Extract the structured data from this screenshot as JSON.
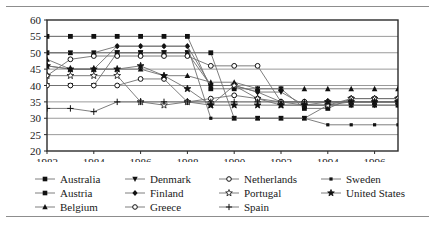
{
  "chart_data": {
    "type": "line",
    "title": "",
    "xlabel": "",
    "ylabel": "",
    "xlim": [
      1982,
      1997
    ],
    "ylim": [
      20,
      60
    ],
    "ytick_step": 5,
    "yticks": [
      20,
      25,
      30,
      35,
      40,
      45,
      50,
      55,
      60
    ],
    "xticks": [
      1982,
      1984,
      1986,
      1988,
      1990,
      1992,
      1994,
      1996
    ],
    "xtick_labels": [
      "1982",
      "1984",
      "1986",
      "1988",
      "1990",
      "1992",
      "1994",
      "1996"
    ],
    "x": [
      1982,
      1983,
      1984,
      1985,
      1986,
      1987,
      1988,
      1989,
      1990,
      1991,
      1992,
      1993,
      1994,
      1995,
      1996,
      1997
    ],
    "grid": true,
    "grid_axis": "y",
    "legend_position": "below",
    "legend_columns": 4,
    "series": [
      {
        "name": "Australia",
        "marker": "square-filled",
        "values": [
          55,
          55,
          55,
          55,
          55,
          55,
          55,
          39,
          39,
          39,
          39,
          33,
          33,
          36,
          36,
          36
        ]
      },
      {
        "name": "Austria",
        "marker": "square-filled",
        "values": [
          50,
          50,
          50,
          50,
          50,
          50,
          50,
          50,
          30,
          30,
          30,
          30,
          34,
          34,
          34,
          34
        ]
      },
      {
        "name": "Belgium",
        "marker": "triangle-filled",
        "values": [
          48,
          45,
          45,
          45,
          45,
          43,
          43,
          41,
          41,
          39,
          39,
          39,
          39,
          39,
          39,
          39
        ]
      },
      {
        "name": "Denmark",
        "marker": "triangle-down",
        "values": [
          40,
          40,
          40,
          50,
          50,
          50,
          50,
          40,
          40,
          38,
          38,
          34,
          34,
          34,
          34,
          34
        ]
      },
      {
        "name": "Finland",
        "marker": "diamond-filled",
        "values": [
          46,
          45,
          45,
          52,
          52,
          52,
          52,
          40,
          40,
          38,
          35,
          34,
          34,
          35,
          35,
          35
        ]
      },
      {
        "name": "Greece",
        "marker": "circle-open",
        "values": [
          43,
          48,
          49,
          49,
          49,
          49,
          49,
          46,
          46,
          46,
          35,
          35,
          35,
          35,
          35,
          35
        ]
      },
      {
        "name": "Netherlands",
        "marker": "circle-open",
        "values": [
          40,
          40,
          40,
          40,
          42,
          42,
          35,
          36,
          37,
          36,
          35,
          35,
          35,
          35,
          35,
          35
        ]
      },
      {
        "name": "Portugal",
        "marker": "star-open",
        "values": [
          43,
          43,
          43,
          43,
          35,
          34,
          35,
          34,
          40,
          36,
          34,
          34,
          34,
          36,
          36,
          36
        ]
      },
      {
        "name": "Spain",
        "marker": "plus",
        "values": [
          33,
          33,
          32,
          35,
          35,
          35,
          35,
          35,
          35,
          35,
          35,
          35,
          35,
          35,
          35,
          35
        ]
      },
      {
        "name": "Sweden",
        "marker": "square-small",
        "values": [
          50,
          50,
          50,
          52,
          52,
          52,
          52,
          30,
          30,
          30,
          30,
          30,
          28,
          28,
          28,
          28
        ]
      },
      {
        "name": "United States",
        "marker": "star-filled",
        "values": [
          46,
          45,
          45,
          45,
          46,
          43,
          39,
          34,
          34,
          34,
          34,
          34,
          35,
          35,
          35,
          35
        ]
      }
    ]
  },
  "legend": {
    "columns": [
      {
        "items": [
          {
            "label": "Australia",
            "marker": "square-filled"
          },
          {
            "label": "Austria",
            "marker": "square-filled"
          },
          {
            "label": "Belgium",
            "marker": "triangle-filled"
          }
        ]
      },
      {
        "items": [
          {
            "label": "Denmark",
            "marker": "triangle-down"
          },
          {
            "label": "Finland",
            "marker": "diamond-filled"
          },
          {
            "label": "Greece",
            "marker": "circle-open"
          }
        ]
      },
      {
        "items": [
          {
            "label": "Netherlands",
            "marker": "circle-open"
          },
          {
            "label": "Portugal",
            "marker": "star-open"
          },
          {
            "label": "Spain",
            "marker": "plus"
          }
        ]
      },
      {
        "items": [
          {
            "label": "Sweden",
            "marker": "square-small"
          },
          {
            "label": "United States",
            "marker": "star-filled"
          }
        ]
      }
    ]
  },
  "colors": {
    "line": "#6f6f6f",
    "marker": "#111111",
    "grid": "#9a9a9a",
    "frame": "#2b2b2b",
    "rule": "#8d8d8d",
    "text": "#1a1a1a",
    "background": "#ffffff"
  }
}
